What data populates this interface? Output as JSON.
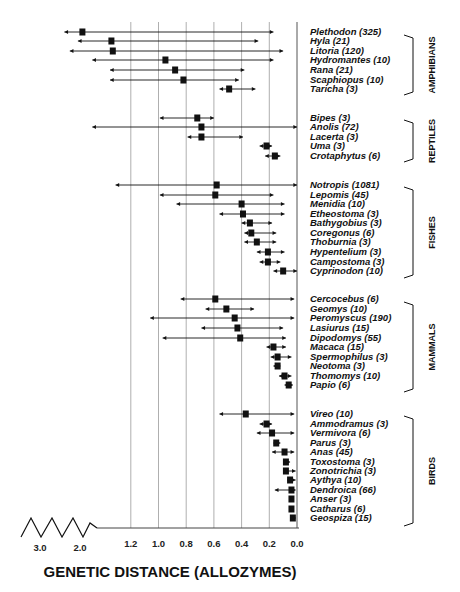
{
  "chart_data": {
    "type": "scatter",
    "subtype": "point-with-range (horizontal error bars)",
    "title": "",
    "xlabel": "GENETIC DISTANCE (ALLOZYMES)",
    "ylabel": "",
    "x_axis": {
      "reversed": true,
      "broken_axis": true,
      "ticks": [
        "1.2",
        "1.0",
        "0.8",
        "0.6",
        "0.4",
        "0.2",
        "0.0"
      ],
      "break_ticks": [
        "3.0",
        "2.0"
      ],
      "grid": true
    },
    "legend": "none",
    "groups": [
      {
        "name": "AMPHIBIANS",
        "taxa": [
          {
            "label": "Plethodon  (325)",
            "genus": "Plethodon",
            "n": 325,
            "mean": 1.63,
            "min": 0.17,
            "max": 1.83
          },
          {
            "label": "Hyla  (21)",
            "genus": "Hyla",
            "n": 21,
            "mean": 1.34,
            "min": 0.28,
            "max": 1.68
          },
          {
            "label": "Litoria  (120)",
            "genus": "Litoria",
            "n": 120,
            "mean": 1.33,
            "min": 0.1,
            "max": 1.77
          },
          {
            "label": "Hydromantes  (10)",
            "genus": "Hydromantes",
            "n": 10,
            "mean": 0.95,
            "min": 0.17,
            "max": 1.52
          },
          {
            "label": "Rana  (21)",
            "genus": "Rana",
            "n": 21,
            "mean": 0.88,
            "min": 0.38,
            "max": 1.35
          },
          {
            "label": "Scaphiopus  (10)",
            "genus": "Scaphiopus",
            "n": 10,
            "mean": 0.82,
            "min": 0.42,
            "max": 1.35
          },
          {
            "label": "Taricha  (3)",
            "genus": "Taricha",
            "n": 3,
            "mean": 0.49,
            "min": 0.3,
            "max": 0.56
          }
        ]
      },
      {
        "name": "REPTILES",
        "taxa": [
          {
            "label": "Bipes  (3)",
            "genus": "Bipes",
            "n": 3,
            "mean": 0.72,
            "min": 0.6,
            "max": 0.99
          },
          {
            "label": "Anolis  (72)",
            "genus": "Anolis",
            "n": 72,
            "mean": 0.69,
            "min": 0.0,
            "max": 1.52
          },
          {
            "label": "Lacerta  (3)",
            "genus": "Lacerta",
            "n": 3,
            "mean": 0.69,
            "min": 0.39,
            "max": 0.79
          },
          {
            "label": "Uma  (3)",
            "genus": "Uma",
            "n": 3,
            "mean": 0.22,
            "min": 0.18,
            "max": 0.27
          },
          {
            "label": "Crotaphytus  (6)",
            "genus": "Crotaphytus",
            "n": 6,
            "mean": 0.16,
            "min": 0.12,
            "max": 0.23
          }
        ]
      },
      {
        "name": "FISHES",
        "taxa": [
          {
            "label": "Notropis  (1081)",
            "genus": "Notropis",
            "n": 1081,
            "mean": 0.58,
            "min": 0.0,
            "max": 1.31
          },
          {
            "label": "Lepomis  (45)",
            "genus": "Lepomis",
            "n": 45,
            "mean": 0.59,
            "min": 0.17,
            "max": 0.99
          },
          {
            "label": "Menidia  (10)",
            "genus": "Menidia",
            "n": 10,
            "mean": 0.4,
            "min": 0.09,
            "max": 0.87
          },
          {
            "label": "Etheostoma  (3)",
            "genus": "Etheostoma",
            "n": 3,
            "mean": 0.39,
            "min": 0.09,
            "max": 0.56
          },
          {
            "label": "Bathygobius  (3)",
            "genus": "Bathygobius",
            "n": 3,
            "mean": 0.34,
            "min": 0.18,
            "max": 0.4
          },
          {
            "label": "Coregonus  (6)",
            "genus": "Coregonus",
            "n": 6,
            "mean": 0.33,
            "min": 0.15,
            "max": 0.38
          },
          {
            "label": "Thoburnia  (3)",
            "genus": "Thoburnia",
            "n": 3,
            "mean": 0.29,
            "min": 0.15,
            "max": 0.38
          },
          {
            "label": "Hypentelium  (3)",
            "genus": "Hypentelium",
            "n": 3,
            "mean": 0.21,
            "min": 0.09,
            "max": 0.29
          },
          {
            "label": "Campostoma  (3)",
            "genus": "Campostoma",
            "n": 3,
            "mean": 0.21,
            "min": 0.12,
            "max": 0.27
          },
          {
            "label": "Cyprinodon  (10)",
            "genus": "Cyprinodon",
            "n": 10,
            "mean": 0.1,
            "min": 0.0,
            "max": 0.17
          }
        ]
      },
      {
        "name": "MAMMALS",
        "taxa": [
          {
            "label": "Cercocebus  (6)",
            "genus": "Cercocebus",
            "n": 6,
            "mean": 0.59,
            "min": 0.02,
            "max": 0.84
          },
          {
            "label": "Geomys  (10)",
            "genus": "Geomys",
            "n": 10,
            "mean": 0.51,
            "min": 0.31,
            "max": 0.66
          },
          {
            "label": "Peromyscus  (190)",
            "genus": "Peromyscus",
            "n": 190,
            "mean": 0.45,
            "min": 0.02,
            "max": 1.06
          },
          {
            "label": "Lasiurus  (15)",
            "genus": "Lasiurus",
            "n": 15,
            "mean": 0.43,
            "min": 0.1,
            "max": 0.69
          },
          {
            "label": "Dipodomys  (55)",
            "genus": "Dipodomys",
            "n": 55,
            "mean": 0.41,
            "min": 0.08,
            "max": 0.97
          },
          {
            "label": "Macaca  (15)",
            "genus": "Macaca",
            "n": 15,
            "mean": 0.17,
            "min": 0.08,
            "max": 0.22
          },
          {
            "label": "Spermophilus  (3)",
            "genus": "Spermophilus",
            "n": 3,
            "mean": 0.14,
            "min": 0.04,
            "max": 0.19
          },
          {
            "label": "Neotoma  (3)",
            "genus": "Neotoma",
            "n": 3,
            "mean": 0.14,
            "min": 0.12,
            "max": 0.17
          },
          {
            "label": "Thomomys  (10)",
            "genus": "Thomomys",
            "n": 10,
            "mean": 0.09,
            "min": 0.04,
            "max": 0.13
          },
          {
            "label": "Papio  (6)",
            "genus": "Papio",
            "n": 6,
            "mean": 0.06,
            "min": 0.03,
            "max": 0.09
          }
        ]
      },
      {
        "name": "BIRDS",
        "taxa": [
          {
            "label": "Vireo  (10)",
            "genus": "Vireo",
            "n": 10,
            "mean": 0.37,
            "min": 0.02,
            "max": 0.56
          },
          {
            "label": "Ammodramus  (3)",
            "genus": "Ammodramus",
            "n": 3,
            "mean": 0.22,
            "min": 0.18,
            "max": 0.27
          },
          {
            "label": "Vermivora  (6)",
            "genus": "Vermivora",
            "n": 6,
            "mean": 0.18,
            "min": 0.02,
            "max": 0.29
          },
          {
            "label": "Parus  (3)",
            "genus": "Parus",
            "n": 3,
            "mean": 0.15,
            "min": 0.12,
            "max": 0.17
          },
          {
            "label": "Anas  (45)",
            "genus": "Anas",
            "n": 45,
            "mean": 0.09,
            "min": 0.02,
            "max": 0.18
          },
          {
            "label": "Toxostoma  (3)",
            "genus": "Toxostoma",
            "n": 3,
            "mean": 0.08,
            "min": 0.05,
            "max": 0.1
          },
          {
            "label": "Zonotrichia  (3)",
            "genus": "Zonotrichia",
            "n": 3,
            "mean": 0.08,
            "min": 0.01,
            "max": 0.1
          },
          {
            "label": "Aythya  (10)",
            "genus": "Aythya",
            "n": 10,
            "mean": 0.05,
            "min": 0.01,
            "max": 0.07
          },
          {
            "label": "Dendroica  (66)",
            "genus": "Dendroica",
            "n": 66,
            "mean": 0.04,
            "min": 0.01,
            "max": 0.16
          },
          {
            "label": "Anser  (3)",
            "genus": "Anser",
            "n": 3,
            "mean": 0.04,
            "min": 0.04,
            "max": 0.04
          },
          {
            "label": "Catharus  (6)",
            "genus": "Catharus",
            "n": 6,
            "mean": 0.04,
            "min": 0.04,
            "max": 0.04
          },
          {
            "label": "Geospiza  (15)",
            "genus": "Geospiza",
            "n": 15,
            "mean": 0.03,
            "min": 0.01,
            "max": 0.05
          }
        ]
      }
    ]
  },
  "layout": {
    "row_y": {
      "AMPHIBIANS": [
        32,
        41,
        51,
        60,
        70,
        80,
        89
      ],
      "REPTILES": [
        118,
        127,
        137,
        146,
        156
      ],
      "FISHES": [
        185,
        195,
        204,
        214,
        223,
        233,
        242,
        252,
        262,
        271
      ],
      "MAMMALS": [
        299,
        309,
        318,
        328,
        338,
        347,
        357,
        366,
        376,
        385
      ],
      "BIRDS": [
        414,
        424,
        433,
        443,
        452,
        462,
        471,
        480,
        490,
        499,
        509,
        518
      ]
    },
    "brackets": {
      "AMPHIBIANS": [
        35,
        95
      ],
      "REPTILES": [
        120,
        162
      ],
      "FISHES": [
        187,
        278
      ],
      "MAMMALS": [
        302,
        392
      ],
      "BIRDS": [
        416,
        526
      ]
    }
  },
  "colors": {
    "ink": "#111111",
    "grid": "#9a9a9a",
    "background": "#ffffff"
  }
}
